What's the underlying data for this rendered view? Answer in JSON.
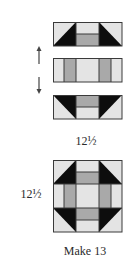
{
  "colors": {
    "light": "#e4e4e4",
    "medium": "#a9a9a9",
    "dark": "#0d0d0d",
    "outline": "#3a3a3a",
    "background": "#ffffff"
  },
  "strips": [
    {
      "id": "top-strip",
      "orientation": "triangles-down",
      "description": "Flying-geese corners with split center (light over medium)"
    },
    {
      "id": "middle-strip",
      "orientation": "vertical-columns",
      "description": "Light / medium / light / medium / light columns"
    },
    {
      "id": "bottom-strip",
      "orientation": "triangles-up",
      "description": "Mirror of top strip (medium over light)"
    }
  ],
  "arrows": {
    "up": "up-arrow",
    "down": "down-arrow"
  },
  "labels": {
    "strip_width": "12½",
    "block_height": "12½",
    "instruction": "Make 13"
  }
}
